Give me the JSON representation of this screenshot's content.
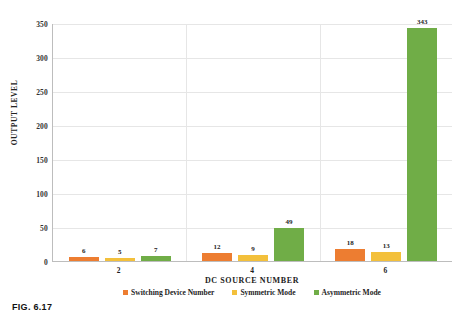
{
  "caption": "FIG. 6.17",
  "chart_data": {
    "type": "bar",
    "title": "",
    "xlabel": "DC SOURCE NUMBER",
    "ylabel": "OUTPUT LEVEL",
    "categories": [
      "2",
      "4",
      "6"
    ],
    "series": [
      {
        "name": "Switching Device Number",
        "color": "#ED7D31",
        "values": [
          6,
          12,
          18
        ]
      },
      {
        "name": "Symmetric Mode",
        "color": "#F3C03B",
        "values": [
          5,
          9,
          13
        ]
      },
      {
        "name": "Asymmetric Mode",
        "color": "#70AD47",
        "values": [
          7,
          49,
          343
        ]
      }
    ],
    "ylim": [
      0,
      350
    ],
    "yticks": [
      0,
      50,
      100,
      150,
      200,
      250,
      300,
      350
    ],
    "grid": true,
    "legend_position": "bottom"
  }
}
